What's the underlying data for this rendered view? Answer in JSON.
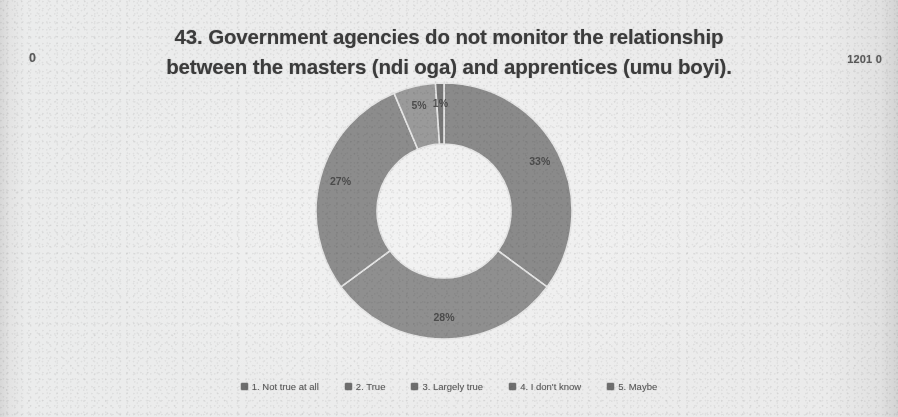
{
  "page": {
    "background_color": "#ebebeb",
    "marker_left": "0",
    "marker_right": "1201 0"
  },
  "chart_data": {
    "type": "pie",
    "variant": "doughnut",
    "title": "43. Government agencies do not monitor the relationship between the masters (ndi oga) and apprentices (umu boyi).",
    "title_line_1": "43. Government agencies do not monitor the relationship",
    "title_line_2": "between the masters (ndi oga) and apprentices (umu boyi).",
    "xlabel": "",
    "ylabel": "",
    "legend_position": "bottom",
    "grid": false,
    "categories": [
      "1. Not true at all",
      "2. True",
      "3. Largely true",
      "4. I don't know",
      "5. Maybe"
    ],
    "values": [
      33,
      28,
      27,
      5,
      1
    ],
    "data_labels": [
      "33%",
      "28%",
      "27%",
      "5%",
      "1%"
    ],
    "colors": [
      "#8a8a8a",
      "#8f8f8f",
      "#8c8c8c",
      "#9b9b9b",
      "#767676"
    ],
    "slices": [
      {
        "label": "1. Not true at all",
        "value": 33,
        "data_label": "33%",
        "color": "#8a8a8a"
      },
      {
        "label": "2. True",
        "value": 28,
        "data_label": "28%",
        "color": "#8f8f8f"
      },
      {
        "label": "3. Largely true",
        "value": 27,
        "data_label": "27%",
        "color": "#8c8c8c"
      },
      {
        "label": "4. I don't know",
        "value": 5,
        "data_label": "5%",
        "color": "#9b9b9b"
      },
      {
        "label": "5. Maybe",
        "value": 1,
        "data_label": "1%",
        "color": "#767676"
      }
    ]
  },
  "legend": {
    "items": [
      {
        "label": "1. Not true at all",
        "color": "#6e6e6e"
      },
      {
        "label": "2. True",
        "color": "#6e6e6e"
      },
      {
        "label": "3. Largely true",
        "color": "#6e6e6e"
      },
      {
        "label": "4. I don't know",
        "color": "#6e6e6e"
      },
      {
        "label": "5. Maybe",
        "color": "#6e6e6e"
      }
    ]
  }
}
